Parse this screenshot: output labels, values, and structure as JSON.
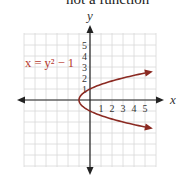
{
  "caption": "not a function",
  "chart_data": {
    "type": "line",
    "title": "not a function",
    "equation_label": "x = y² − 1",
    "xlabel": "x",
    "ylabel": "y",
    "x_ticks": [
      "1",
      "2",
      "3",
      "4",
      "5"
    ],
    "y_ticks": [
      "1",
      "2",
      "3",
      "4",
      "5"
    ],
    "xlim": [
      -6,
      6
    ],
    "ylim": [
      -6,
      6
    ],
    "grid": true,
    "series": [
      {
        "name": "x = y^2 - 1",
        "color": "#8b2a22",
        "points": [
          {
            "x": 5.76,
            "y": -2.6
          },
          {
            "x": 3,
            "y": -2
          },
          {
            "x": 1.25,
            "y": -1.5
          },
          {
            "x": 0,
            "y": -1
          },
          {
            "x": -0.75,
            "y": -0.5
          },
          {
            "x": -1,
            "y": 0
          },
          {
            "x": -0.75,
            "y": 0.5
          },
          {
            "x": 0,
            "y": 1
          },
          {
            "x": 1.25,
            "y": 1.5
          },
          {
            "x": 3,
            "y": 2
          },
          {
            "x": 5.76,
            "y": 2.6
          }
        ]
      }
    ]
  },
  "colors": {
    "curve": "#8b2a22",
    "label": "#b5382d",
    "grid": "#d8d8d8",
    "axis": "#222222"
  }
}
